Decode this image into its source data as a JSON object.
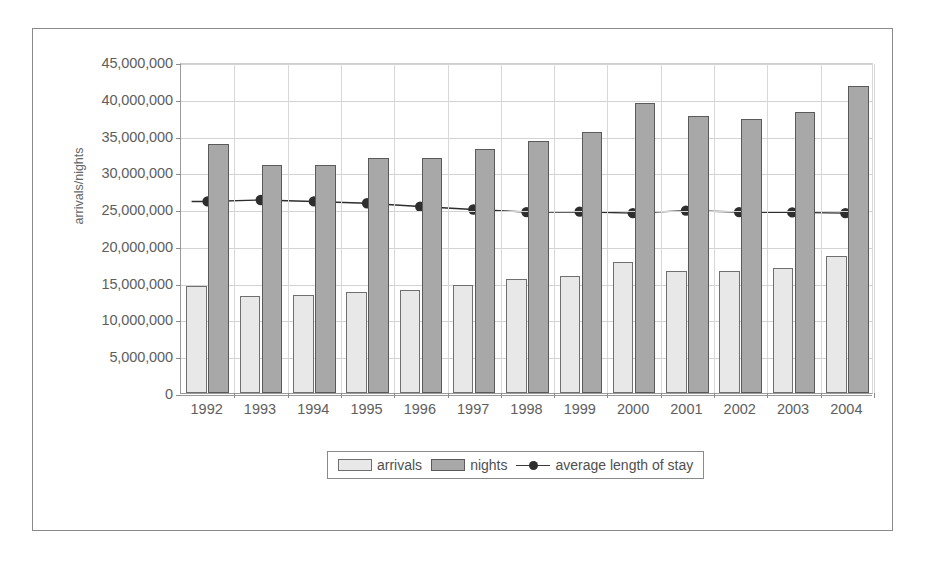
{
  "chart_data": {
    "type": "bar",
    "title": "",
    "subtitle": "",
    "xlabel": "",
    "ylabel": "arrivals/nights",
    "ylim": [
      0,
      45000000
    ],
    "ytick_step": 5000000,
    "ytick_labels": [
      "45,000,000",
      "40,000,000",
      "35,000,000",
      "30,000,000",
      "25,000,000",
      "20,000,000",
      "15,000,000",
      "10,000,000",
      "5,000,000",
      "0"
    ],
    "ytick_values": [
      45000000,
      40000000,
      35000000,
      30000000,
      25000000,
      20000000,
      15000000,
      10000000,
      5000000,
      0
    ],
    "grid": true,
    "legend_position": "bottom",
    "categories": [
      "1992",
      "1993",
      "1994",
      "1995",
      "1996",
      "1997",
      "1998",
      "1999",
      "2000",
      "2001",
      "2002",
      "2003",
      "2004"
    ],
    "series": [
      {
        "name": "arrivals",
        "type": "bar",
        "color": "#e8e8e8",
        "border_color": "#6f6f6f",
        "values": [
          14500000,
          13200000,
          13350000,
          13700000,
          13950000,
          14750000,
          15450000,
          15850000,
          17800000,
          16550000,
          16650000,
          16950000,
          18600000
        ]
      },
      {
        "name": "nights",
        "type": "bar",
        "color": "#a8a8a8",
        "border_color": "#5a5a5a",
        "values": [
          33900000,
          31000000,
          31050000,
          31900000,
          32000000,
          33200000,
          34300000,
          35450000,
          39400000,
          37600000,
          37300000,
          38200000,
          41800000
        ]
      },
      {
        "name": "average length of stay",
        "type": "line",
        "color": "#2e2e2e",
        "values": [
          26200000,
          26400000,
          26200000,
          25950000,
          25500000,
          25100000,
          24750000,
          24800000,
          24600000,
          24950000,
          24750000,
          24700000,
          24600000
        ]
      }
    ]
  },
  "legend": {
    "items": [
      {
        "label": "arrivals",
        "marker": "square-light"
      },
      {
        "label": "nights",
        "marker": "square-dark"
      },
      {
        "label": "average length of stay",
        "marker": "line-with-dot"
      }
    ]
  },
  "colors": {
    "frame": "#8a8a8a",
    "axis": "#9a9a9a",
    "grid": "#d3d3d3",
    "text": "#5e5e5e",
    "arrivals": "#e8e8e8",
    "nights": "#a8a8a8",
    "line": "#2e2e2e"
  }
}
